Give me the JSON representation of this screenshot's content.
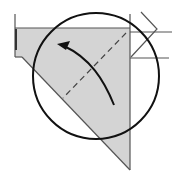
{
  "diagram": {
    "type": "origami-fold-step",
    "colors": {
      "paper_fill": "#d4d4d4",
      "line": "#555555",
      "thick_line": "#111111",
      "background": "#ffffff"
    },
    "elements": {
      "paper_shape": "gray folded paper triangle",
      "circle": "detail magnifier circle",
      "dashed_line": "valley fold line",
      "arrow": "curved fold direction arrow",
      "zigzag": "pleat indicator lines"
    }
  }
}
